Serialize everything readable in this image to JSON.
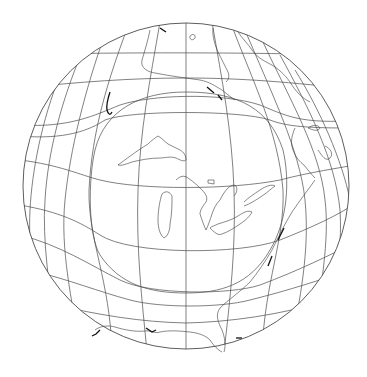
{
  "map": {
    "title": "Oblique projection of North America centered on the Great Lakes",
    "projection": "azimuthal with inner circle of true scale",
    "background_color": "#ffffff",
    "line_color": "#4a4a4a",
    "outer_circle": {
      "cx": 186,
      "cy": 186,
      "r": 163
    },
    "inner_circle": {
      "cx": 186,
      "cy": 186,
      "r": 99
    },
    "features": [
      "Great Lakes",
      "Hudson Bay",
      "Lake Superior",
      "Lake Michigan",
      "Lake Huron",
      "Lake Erie",
      "Lake Ontario",
      "Atlantic coast",
      "Gulf of Mexico coast",
      "Labrador",
      "Newfoundland",
      "Nova Scotia"
    ],
    "labels": []
  }
}
